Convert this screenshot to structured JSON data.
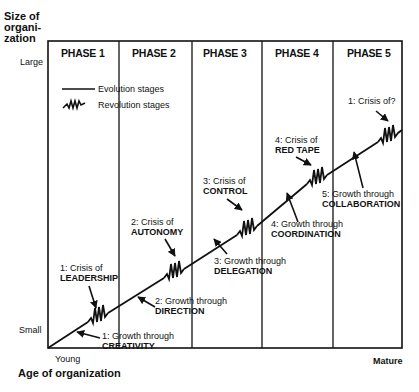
{
  "y_axis": {
    "title_lines": [
      "Size of",
      "organi-",
      "zation"
    ],
    "top_label": "Large",
    "bottom_label": "Small"
  },
  "x_axis": {
    "title": "Age of organization",
    "left_label": "Young",
    "right_label": "Mature"
  },
  "phases": [
    "PHASE 1",
    "PHASE 2",
    "PHASE 3",
    "PHASE 4",
    "PHASE 5"
  ],
  "legend": {
    "evolution": "Evolution stages",
    "revolution": "Revolution stages"
  },
  "growth": [
    {
      "num": "1: Growth through",
      "name": "CREATIVITY"
    },
    {
      "num": "2: Growth through",
      "name": "DIRECTION"
    },
    {
      "num": "3: Growth through",
      "name": "DELEGATION"
    },
    {
      "num": "4: Growth through",
      "name": "COORDINATION"
    },
    {
      "num": "5: Growth through",
      "name": "COLLABORATION"
    }
  ],
  "crises": [
    {
      "num": "1: Crisis of",
      "name": "LEADERSHIP"
    },
    {
      "num": "2: Crisis of",
      "name": "AUTONOMY"
    },
    {
      "num": "3: Crisis of",
      "name": "CONTROL"
    },
    {
      "num": "4: Crisis of",
      "name": "RED TAPE"
    },
    {
      "num": "1: Crisis of?",
      "name": ""
    }
  ]
}
